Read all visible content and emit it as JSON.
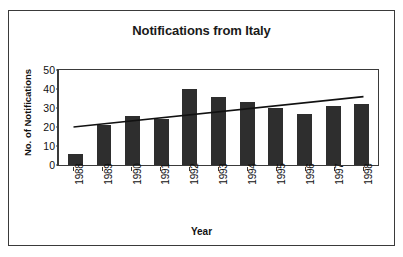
{
  "chart_data": {
    "type": "bar",
    "title": "Notifications from Italy",
    "xlabel": "Year",
    "ylabel": "No. of Notifications",
    "categories": [
      "1988",
      "1989",
      "1990",
      "1991",
      "1992",
      "1993",
      "1994",
      "1995",
      "1996",
      "1997",
      "1998"
    ],
    "values": [
      6,
      21,
      26,
      24,
      40,
      36,
      33,
      30,
      27,
      31,
      32
    ],
    "series": [
      {
        "name": "No. of Notifications",
        "values": [
          6,
          21,
          26,
          24,
          40,
          36,
          33,
          30,
          27,
          31,
          32
        ]
      }
    ],
    "ylim": [
      0,
      50
    ],
    "yticks": [
      0,
      10,
      20,
      30,
      40,
      50
    ],
    "grid": false,
    "legend": "none",
    "bar_color": "#2e2e2e",
    "trendline": {
      "type": "linear",
      "start_value": 20,
      "end_value": 36,
      "color": "#111111"
    }
  }
}
